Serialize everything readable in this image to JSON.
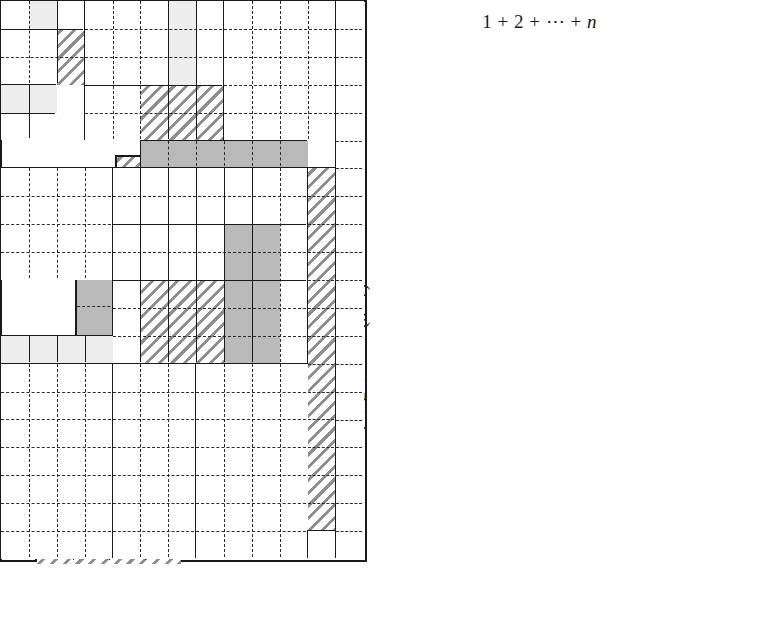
{
  "figure": {
    "kind": "proof-without-words",
    "title_top": "1 + 2 + ⋯ + n",
    "title_left": "1 + 2 + ⋯ + (n+1)",
    "unit_px": 27.8,
    "palette": {
      "ink": "#1a1a1a",
      "white": "#ffffff",
      "light": "#ededed",
      "gray": "#b9b9b9",
      "hatch_line": "#8f8f8f"
    }
  },
  "left_column": {
    "caption": "self-similar square blocks of order 1, 2, 3, 4",
    "blocks": [
      {
        "name": "order-1-square",
        "order": 1,
        "x": 150,
        "y": 84,
        "size": 36,
        "cells": [
          {
            "x": 0,
            "y": 0,
            "w": 1,
            "h": 1,
            "fill": "white"
          }
        ],
        "dash_v": [],
        "dash_h": [],
        "solid_v": [],
        "solid_h": []
      },
      {
        "name": "order-2-square",
        "order": 2,
        "x": 115,
        "y": 155,
        "size": 72,
        "cells": [
          {
            "x": 0,
            "y": 0,
            "w": 1,
            "h": 2,
            "fill": "hatch"
          },
          {
            "x": 1,
            "y": 0,
            "w": 1,
            "h": 1,
            "fill": "light"
          },
          {
            "x": 1,
            "y": 1,
            "w": 1,
            "h": 1,
            "fill": "hatch"
          },
          {
            "x": 0,
            "y": 1,
            "w": 1,
            "h": 1,
            "fill": "hatch"
          }
        ],
        "dash_v": [
          1
        ],
        "dash_h": [
          1
        ],
        "solid_v": [
          1
        ],
        "solid_h": [
          1
        ]
      },
      {
        "name": "order-3-square",
        "order": 3,
        "x": 75,
        "y": 268,
        "size": 108,
        "cells": [
          {
            "x": 0,
            "y": 0,
            "w": 1,
            "h": 2,
            "fill": "gray"
          },
          {
            "x": 1,
            "y": 0,
            "w": 1,
            "h": 2,
            "fill": "hatch"
          },
          {
            "x": 2,
            "y": 0,
            "w": 1,
            "h": 1,
            "fill": "light"
          },
          {
            "x": 2,
            "y": 1,
            "w": 1,
            "h": 1,
            "fill": "hatch"
          },
          {
            "x": 0,
            "y": 2,
            "w": 3,
            "h": 1,
            "fill": "gray"
          }
        ],
        "dash_v": [
          1,
          2
        ],
        "dash_h": [
          1,
          2
        ],
        "solid_v": [
          1,
          2
        ],
        "solid_h": [
          2
        ]
      },
      {
        "name": "order-4-square",
        "order": 4,
        "x": 35,
        "y": 418,
        "size": 144,
        "cells": [
          {
            "x": 0,
            "y": 0,
            "w": 1,
            "h": 3,
            "fill": "hatch"
          },
          {
            "x": 1,
            "y": 0,
            "w": 1,
            "h": 2,
            "fill": "gray"
          },
          {
            "x": 2,
            "y": 0,
            "w": 1,
            "h": 2,
            "fill": "hatch"
          },
          {
            "x": 3,
            "y": 0,
            "w": 1,
            "h": 1,
            "fill": "light"
          },
          {
            "x": 3,
            "y": 1,
            "w": 1,
            "h": 1,
            "fill": "hatch"
          },
          {
            "x": 1,
            "y": 2,
            "w": 3,
            "h": 1,
            "fill": "gray"
          },
          {
            "x": 0,
            "y": 3,
            "w": 4,
            "h": 1,
            "fill": "hatch"
          }
        ],
        "dash_v": [
          1,
          2,
          3
        ],
        "dash_h": [
          1,
          2,
          3
        ],
        "solid_v": [
          1,
          2,
          3
        ],
        "solid_h": [
          2,
          3
        ]
      }
    ]
  },
  "grid": {
    "name": "main-rectangle",
    "x": 369,
    "y": 46,
    "cols": 13,
    "rows": 20,
    "cell": 27.9,
    "blocks": [
      {
        "name": "blk-r1c1-order3",
        "gx": 0,
        "gy": 0,
        "gw": 3,
        "gh": 3,
        "cells": [
          {
            "x": 0,
            "y": 0,
            "w": 1,
            "h": 1,
            "fill": "white"
          },
          {
            "x": 1,
            "y": 0,
            "w": 1,
            "h": 1,
            "fill": "light"
          },
          {
            "x": 2,
            "y": 0,
            "w": 1,
            "h": 1,
            "fill": "white"
          },
          {
            "x": 0,
            "y": 1,
            "w": 2,
            "h": 2,
            "fill": "white"
          },
          {
            "x": 2,
            "y": 1,
            "w": 1,
            "h": 2,
            "fill": "hatch"
          }
        ],
        "dash_v": [
          1,
          2
        ],
        "dash_h": [
          1,
          2
        ],
        "solid_v": [
          2
        ],
        "solid_h": [
          1
        ]
      },
      {
        "name": "blk-r1c4-order5",
        "gx": 3,
        "gy": 0,
        "gw": 5,
        "gh": 5,
        "cells": [
          {
            "x": 0,
            "y": 0,
            "w": 5,
            "h": 5,
            "fill": "white"
          },
          {
            "x": 3,
            "y": 0,
            "w": 1,
            "h": 3,
            "fill": "light"
          },
          {
            "x": 2,
            "y": 3,
            "w": 3,
            "h": 2,
            "fill": "hatch"
          }
        ],
        "dash_v": [
          1,
          2,
          3,
          4
        ],
        "dash_h": [
          1,
          2,
          3,
          4
        ],
        "solid_v": [
          3,
          4
        ],
        "solid_h": [
          3
        ]
      },
      {
        "name": "blk-r1c9-order5",
        "gx": 8,
        "gy": 0,
        "gw": 5,
        "gh": 5,
        "cells": [
          {
            "x": 0,
            "y": 0,
            "w": 5,
            "h": 5,
            "fill": "white"
          }
        ],
        "dash_v": [
          1,
          2,
          3,
          4
        ],
        "dash_h": [
          1,
          2,
          3,
          4
        ],
        "solid_v": [],
        "solid_h": []
      },
      {
        "name": "blk-r4c1-order2",
        "gx": 0,
        "gy": 3,
        "gw": 2,
        "gh": 2,
        "cells": [
          {
            "x": 0,
            "y": 0,
            "w": 1,
            "h": 1,
            "fill": "light"
          },
          {
            "x": 1,
            "y": 0,
            "w": 1,
            "h": 1,
            "fill": "light"
          },
          {
            "x": 0,
            "y": 1,
            "w": 2,
            "h": 1,
            "fill": "white"
          }
        ],
        "dash_v": [
          1
        ],
        "dash_h": [
          1
        ],
        "solid_v": [
          1
        ],
        "solid_h": [
          1
        ]
      },
      {
        "name": "blk-r6-gray-bar",
        "gx": 5,
        "gy": 5,
        "gw": 6,
        "gh": 1,
        "cells": [
          {
            "x": 0,
            "y": 0,
            "w": 6,
            "h": 1,
            "fill": "gray"
          }
        ],
        "dash_v": [
          1,
          2,
          3,
          4,
          5
        ],
        "dash_h": [],
        "solid_v": [],
        "solid_h": []
      },
      {
        "name": "blk-r7c1-order4",
        "gx": 0,
        "gy": 6,
        "gw": 4,
        "gh": 4,
        "cells": [
          {
            "x": 0,
            "y": 0,
            "w": 4,
            "h": 4,
            "fill": "white"
          }
        ],
        "dash_v": [
          1,
          2,
          3
        ],
        "dash_h": [
          1,
          2,
          3
        ],
        "solid_v": [],
        "solid_h": []
      },
      {
        "name": "blk-r7c5-order7",
        "gx": 4,
        "gy": 6,
        "gw": 7,
        "gh": 7,
        "cells": [
          {
            "x": 0,
            "y": 0,
            "w": 7,
            "h": 7,
            "fill": "white"
          },
          {
            "x": 1,
            "y": 4,
            "w": 3,
            "h": 3,
            "fill": "hatch"
          },
          {
            "x": 4,
            "y": 2,
            "w": 2,
            "h": 5,
            "fill": "gray"
          }
        ],
        "dash_v": [
          1,
          2,
          3,
          4,
          5,
          6
        ],
        "dash_h": [
          1,
          2,
          3,
          4,
          5,
          6
        ],
        "solid_v": [
          1,
          2,
          3,
          4,
          5
        ],
        "solid_h": [
          4,
          2
        ]
      },
      {
        "name": "blk-r7c12-hatch-col",
        "gx": 11,
        "gy": 6,
        "gw": 1,
        "gh": 13,
        "cells": [
          {
            "x": 0,
            "y": 0,
            "w": 1,
            "h": 13,
            "fill": "hatch"
          }
        ],
        "dash_v": [],
        "dash_h": [
          1,
          2,
          3,
          4,
          5,
          6,
          7,
          8,
          9,
          10,
          11,
          12
        ],
        "solid_v": [],
        "solid_h": []
      },
      {
        "name": "blk-r12c1-light-bar",
        "gx": 0,
        "gy": 12,
        "gw": 4,
        "gh": 1,
        "cells": [
          {
            "x": 0,
            "y": 0,
            "w": 4,
            "h": 1,
            "fill": "light"
          }
        ],
        "dash_v": [],
        "dash_h": [],
        "solid_v": [
          1,
          2,
          3
        ],
        "solid_h": []
      },
      {
        "name": "blk-r14c1-order4",
        "gx": 0,
        "gy": 13,
        "gw": 4,
        "gh": 7,
        "cells": [
          {
            "x": 0,
            "y": 0,
            "w": 4,
            "h": 7,
            "fill": "white"
          }
        ],
        "dash_v": [
          1,
          2,
          3
        ],
        "dash_h": [
          1,
          2,
          3,
          4,
          5,
          6
        ],
        "solid_v": [],
        "solid_h": []
      },
      {
        "name": "blk-r14c5-rest",
        "gx": 4,
        "gy": 13,
        "gw": 3,
        "gh": 7,
        "cells": [
          {
            "x": 0,
            "y": 0,
            "w": 3,
            "h": 7,
            "fill": "white"
          }
        ],
        "dash_v": [
          1,
          2
        ],
        "dash_h": [
          1,
          2,
          3,
          4,
          5,
          6
        ],
        "solid_v": [],
        "solid_h": []
      },
      {
        "name": "blk-r14c8-rest",
        "gx": 7,
        "gy": 13,
        "gw": 4,
        "gh": 7,
        "cells": [
          {
            "x": 0,
            "y": 0,
            "w": 4,
            "h": 7,
            "fill": "white"
          }
        ],
        "dash_v": [
          1,
          2,
          3
        ],
        "dash_h": [
          1,
          2,
          3,
          4,
          5,
          6
        ],
        "solid_v": [],
        "solid_h": []
      },
      {
        "name": "blk-r20c12-white",
        "gx": 11,
        "gy": 19,
        "gw": 1,
        "gh": 1,
        "cells": [
          {
            "x": 0,
            "y": 0,
            "w": 1,
            "h": 1,
            "fill": "white"
          }
        ],
        "dash_v": [],
        "dash_h": [],
        "solid_v": [],
        "solid_h": []
      },
      {
        "name": "blk-col13",
        "gx": 12,
        "gy": 0,
        "gw": 1,
        "gh": 20,
        "cells": [
          {
            "x": 0,
            "y": 0,
            "w": 1,
            "h": 20,
            "fill": "white"
          }
        ],
        "dash_v": [],
        "dash_h": [
          1,
          2,
          3,
          4,
          5,
          6,
          7,
          8,
          9,
          10,
          11,
          12,
          13,
          14,
          15,
          16,
          17,
          18,
          19
        ],
        "solid_v": [],
        "solid_h": []
      }
    ]
  }
}
